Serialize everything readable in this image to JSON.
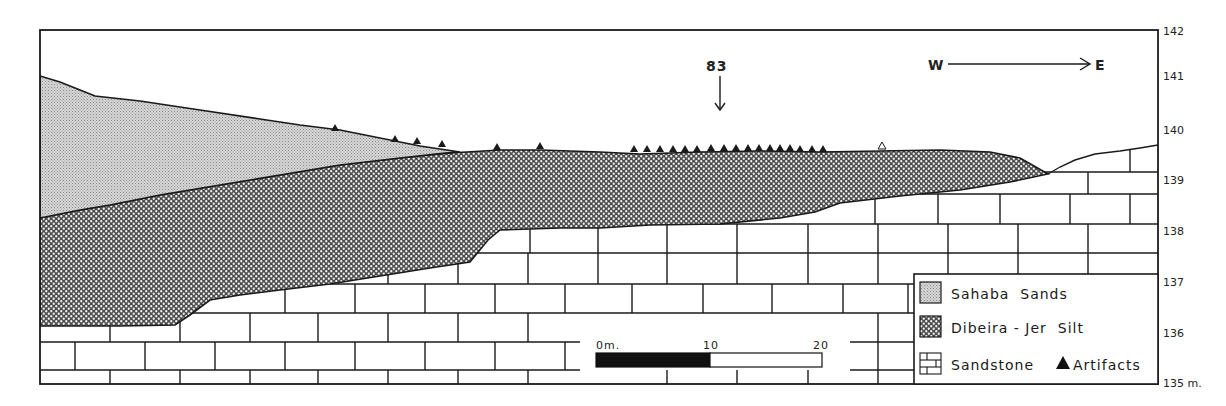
{
  "figure": {
    "type": "geological cross-section",
    "orientation": {
      "west_label": "W",
      "east_label": "E"
    },
    "site_marker": {
      "label": "83"
    },
    "elevation_axis": {
      "ticks": [
        "142",
        "141",
        "140",
        "139",
        "138",
        "137",
        "136",
        "135 m."
      ],
      "values": [
        142,
        141,
        140,
        139,
        138,
        137,
        136,
        135
      ],
      "unit": "m"
    },
    "scale_bar": {
      "labels": [
        "0m.",
        "10",
        "20"
      ],
      "values_m": [
        0,
        10,
        20
      ]
    },
    "legend": {
      "items": [
        {
          "label": "Sahaba  Sands",
          "pattern": "stipple-grey"
        },
        {
          "label": "Dibeira - Jer  Silt",
          "pattern": "crosshatch"
        },
        {
          "label": "Sandstone",
          "pattern": "brick"
        }
      ],
      "artifacts_label": "Artifacts"
    },
    "artifacts": {
      "filled_count": 24,
      "hollow_count": 1
    }
  },
  "colors": {
    "line": "#1a1a1a",
    "sahaba": "#c9c9c9",
    "silt_dark": "#4a4a4a",
    "paper": "#ffffff"
  }
}
